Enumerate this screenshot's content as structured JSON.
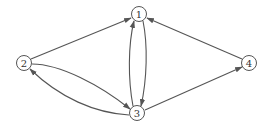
{
  "diagram": {
    "type": "directed-graph",
    "colors": {
      "stroke": "#555555",
      "background": "#ffffff",
      "text": "#333333"
    },
    "nodes": [
      {
        "id": "1",
        "label": "1",
        "x": 139,
        "y": 14
      },
      {
        "id": "2",
        "label": "2",
        "x": 24,
        "y": 63
      },
      {
        "id": "3",
        "label": "3",
        "x": 137,
        "y": 113
      },
      {
        "id": "4",
        "label": "4",
        "x": 249,
        "y": 63
      }
    ],
    "edges": [
      {
        "from": "2",
        "to": "1"
      },
      {
        "from": "4",
        "to": "1"
      },
      {
        "from": "3",
        "to": "1"
      },
      {
        "from": "1",
        "to": "3"
      },
      {
        "from": "2",
        "to": "3"
      },
      {
        "from": "3",
        "to": "2"
      },
      {
        "from": "3",
        "to": "4"
      }
    ]
  }
}
